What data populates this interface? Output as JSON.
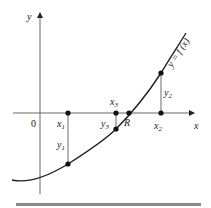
{
  "diagram": {
    "title": "",
    "axes": {
      "x_label": "x",
      "y_label": "y",
      "origin_label": "0"
    },
    "curve_label": "y = f (x)",
    "points": [
      {
        "name": "x1",
        "label": "x",
        "sub": "1",
        "kind": "axis"
      },
      {
        "name": "y1",
        "label": "y",
        "sub": "1",
        "kind": "curve"
      },
      {
        "name": "x2",
        "label": "x",
        "sub": "2",
        "kind": "axis"
      },
      {
        "name": "y2",
        "label": "y",
        "sub": "2",
        "kind": "curve"
      },
      {
        "name": "x3",
        "label": "x",
        "sub": "3",
        "kind": "axis"
      },
      {
        "name": "y3",
        "label": "y",
        "sub": "3",
        "kind": "curve"
      },
      {
        "name": "R",
        "label": "R",
        "kind": "root"
      }
    ],
    "colors": {
      "ink": "#222222",
      "bar": "#8a8a8a"
    }
  }
}
